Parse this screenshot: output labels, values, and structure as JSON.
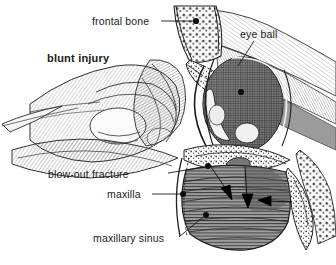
{
  "figure": {
    "style": "grayscale pen-and-ink medical illustration",
    "background_color": "#ffffff",
    "ink_color": "#1a1a1a",
    "width": 336,
    "height": 265
  },
  "labels": {
    "frontal_bone": "frontal bone",
    "eye_ball": "eye ball",
    "blunt_injury": "blunt injury",
    "blow_out_fracture": "blow-out fracture",
    "maxilla": "maxilla",
    "maxillary_sinus": "maxillary sinus"
  },
  "annotations": {
    "arrow_1_name": "force-arrow-diagonal",
    "arrow_2_name": "force-arrow-vertical",
    "arrow_3_name": "force-arrow-horizontal"
  },
  "structures": {
    "fist": "striking fist",
    "orbit": "orbital cavity",
    "globe": "ocular globe",
    "sinus": "maxillary sinus cavity",
    "cancellous_bone": "cancellous bone",
    "soft_tissue": "periorbital soft tissue"
  }
}
